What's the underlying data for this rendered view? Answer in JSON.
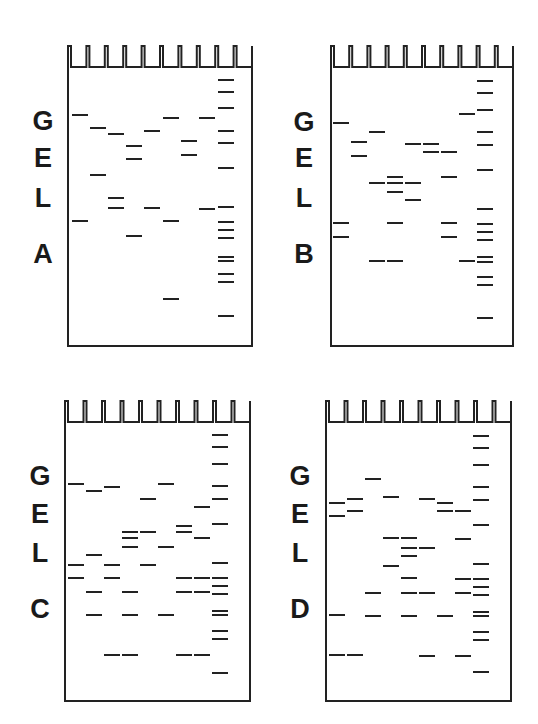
{
  "figure": {
    "title_letters": [
      "G",
      "E",
      "L"
    ],
    "panels": [
      {
        "id": "A",
        "suffix": "A",
        "box": {
          "x": 67,
          "y": 45,
          "w": 186,
          "h": 302
        },
        "label_x": 30,
        "label_y": [
          121,
          158,
          198,
          254
        ],
        "lane_x": [
          72,
          90,
          108,
          126,
          144,
          163,
          181,
          199,
          218
        ],
        "lanes": [
          [
            115,
            221
          ],
          [
            128,
            175
          ],
          [
            134,
            198,
            208
          ],
          [
            146,
            159,
            236
          ],
          [
            131,
            208
          ],
          [
            118,
            221,
            299
          ],
          [
            141,
            155
          ],
          [
            118,
            209
          ],
          [
            80,
            92,
            108,
            131,
            143,
            168,
            207,
            222,
            230,
            238,
            257,
            261,
            274,
            282,
            316
          ]
        ]
      },
      {
        "id": "B",
        "suffix": "B",
        "box": {
          "x": 330,
          "y": 45,
          "w": 184,
          "h": 302
        },
        "label_x": 291,
        "label_y": [
          122,
          158,
          198,
          254
        ],
        "lane_x": [
          333,
          351,
          369,
          387,
          405,
          423,
          441,
          459,
          477
        ],
        "lanes": [
          [
            123,
            223,
            237
          ],
          [
            142,
            156
          ],
          [
            132,
            183,
            261
          ],
          [
            177,
            183,
            192,
            223,
            261
          ],
          [
            144,
            183,
            200
          ],
          [
            144,
            152
          ],
          [
            152,
            177,
            223,
            237
          ],
          [
            114,
            261
          ],
          [
            81,
            93,
            110,
            132,
            145,
            170,
            209,
            224,
            232,
            240,
            257,
            262,
            277,
            285,
            318
          ]
        ]
      },
      {
        "id": "C",
        "suffix": "C",
        "box": {
          "x": 64,
          "y": 400,
          "w": 187,
          "h": 302
        },
        "label_x": 27,
        "label_y": [
          476,
          514,
          553,
          609
        ],
        "lane_x": [
          68,
          86,
          104,
          122,
          140,
          158,
          176,
          194,
          212
        ],
        "lanes": [
          [
            484,
            565,
            578
          ],
          [
            491,
            555,
            592,
            615
          ],
          [
            487,
            565,
            578,
            655
          ],
          [
            532,
            538,
            547,
            592,
            615,
            655
          ],
          [
            499,
            532,
            565
          ],
          [
            484,
            547,
            615
          ],
          [
            526,
            532,
            578,
            592,
            655
          ],
          [
            507,
            538,
            578,
            592,
            655
          ],
          [
            435,
            447,
            464,
            486,
            499,
            524,
            563,
            578,
            586,
            594,
            611,
            615,
            631,
            639,
            673
          ]
        ]
      },
      {
        "id": "D",
        "suffix": "D",
        "box": {
          "x": 325,
          "y": 400,
          "w": 187,
          "h": 302
        },
        "label_x": 287,
        "label_y": [
          476,
          514,
          553,
          609
        ],
        "lane_x": [
          329,
          347,
          365,
          383,
          401,
          419,
          437,
          455,
          473
        ],
        "lanes": [
          [
            503,
            516,
            615,
            655
          ],
          [
            499,
            511,
            655
          ],
          [
            479,
            593,
            616
          ],
          [
            497,
            538,
            566
          ],
          [
            538,
            548,
            556,
            578,
            593,
            616
          ],
          [
            499,
            548,
            593,
            656
          ],
          [
            503,
            511,
            616
          ],
          [
            511,
            539,
            579,
            593,
            656
          ],
          [
            436,
            448,
            465,
            487,
            500,
            525,
            564,
            579,
            587,
            595,
            612,
            616,
            632,
            640,
            672
          ]
        ]
      }
    ],
    "wells_per_gel": 10,
    "ladder_lane_index": 8,
    "band_width": 16,
    "band_color": "#222222",
    "line_color": "#222222"
  }
}
